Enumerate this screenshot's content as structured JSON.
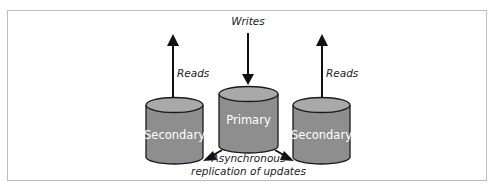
{
  "diagram": {
    "type": "primary-secondary replication",
    "colors": {
      "cylinder_body": "#8e8e8e",
      "cylinder_top": "#a9a9a9",
      "outline": "#1a1a1a",
      "frame_border": "#bdbdbd",
      "label_text": "#222222",
      "db_text": "#ffffff"
    },
    "nodes": [
      {
        "id": "secondary-left",
        "label": "Secondary"
      },
      {
        "id": "primary",
        "label": "Primary"
      },
      {
        "id": "secondary-right",
        "label": "Secondary"
      }
    ],
    "edges": [
      {
        "from": "client",
        "to": "primary",
        "label": "Writes"
      },
      {
        "from": "secondary-left",
        "to": "client",
        "label": "Reads"
      },
      {
        "from": "secondary-right",
        "to": "client",
        "label": "Reads"
      },
      {
        "from": "primary",
        "to": "secondary-left",
        "label": ""
      },
      {
        "from": "primary",
        "to": "secondary-right",
        "label": ""
      }
    ],
    "labels": {
      "writes": "Writes",
      "reads_left": "Reads",
      "reads_right": "Reads",
      "replication_line1": "Asynchronous",
      "replication_line2": "replication of updates"
    }
  }
}
